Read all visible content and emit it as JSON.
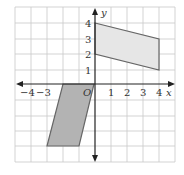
{
  "diagram": {
    "type": "coordinate-grid",
    "x_axis_label": "x",
    "y_axis_label": "y",
    "origin_label": "O",
    "x_ticks": [
      "−4",
      "−3",
      "1",
      "2",
      "3",
      "4"
    ],
    "y_ticks": [
      "4",
      "3",
      "2",
      "1"
    ],
    "grid_range": {
      "x": [
        -5,
        5
      ],
      "y": [
        -5,
        5
      ]
    },
    "shapes": [
      {
        "name": "parallelogram-upper",
        "vertices": [
          [
            0,
            4
          ],
          [
            4,
            3
          ],
          [
            4,
            1
          ],
          [
            0,
            2
          ]
        ],
        "fill": "#e6e6e6",
        "stroke": "#666666"
      },
      {
        "name": "parallelogram-lower",
        "vertices": [
          [
            -2,
            0
          ],
          [
            0,
            0
          ],
          [
            -1,
            -4
          ],
          [
            -3,
            -4
          ]
        ],
        "fill": "#b3b3b3",
        "stroke": "#666666"
      }
    ],
    "colors": {
      "grid": "#c8c8c8",
      "axis": "#222222"
    }
  }
}
